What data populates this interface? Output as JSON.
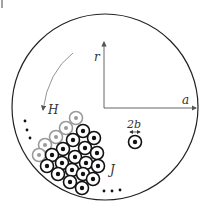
{
  "labels": {
    "r": "r",
    "a": "a",
    "H": "H",
    "J": "J",
    "b": "2b"
  },
  "colors": {
    "line": "#222222",
    "axis": "#555555",
    "gray_conductor": "#9a9a9a",
    "arc": "#888888"
  },
  "diagram": {
    "outer_circle": {
      "cx": 105,
      "cy": 107,
      "r": 93
    },
    "origin": {
      "x": 104,
      "y": 108
    },
    "r_axis_tip": {
      "x": 104,
      "y": 41
    },
    "a_axis_tip": {
      "x": 197,
      "y": 108
    },
    "conductor_radius": 6.5,
    "gray_conductors": [
      [
        76,
        118
      ],
      [
        66,
        128
      ],
      [
        56,
        137
      ],
      [
        45,
        145
      ],
      [
        39,
        155
      ]
    ],
    "black_conductors": [
      [
        83,
        131
      ],
      [
        94,
        138
      ],
      [
        73,
        140
      ],
      [
        85,
        148
      ],
      [
        97,
        153
      ],
      [
        63,
        149
      ],
      [
        75,
        157
      ],
      [
        86,
        163
      ],
      [
        98,
        166
      ],
      [
        52,
        155
      ],
      [
        62,
        163
      ],
      [
        72,
        170
      ],
      [
        83,
        174
      ],
      [
        93,
        179
      ],
      [
        47,
        166
      ],
      [
        58,
        174
      ],
      [
        70,
        182
      ],
      [
        82,
        188
      ]
    ],
    "single_conductor": {
      "cx": 135,
      "cy": 142
    },
    "ellipsis_left": [
      [
        25,
        121
      ],
      [
        27,
        130
      ],
      [
        30,
        138
      ]
    ],
    "ellipsis_bottom": [
      [
        104,
        191
      ],
      [
        112,
        191
      ],
      [
        120,
        190
      ]
    ]
  }
}
